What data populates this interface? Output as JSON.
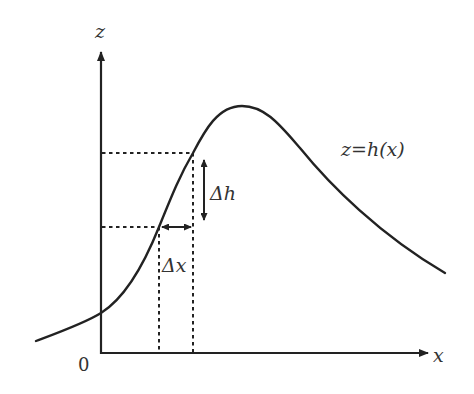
{
  "diagram": {
    "axes": {
      "z_label": "z",
      "x_label": "x",
      "origin_label": "0"
    },
    "curve_label": "z=h(x)",
    "delta_h_label": "Δh",
    "delta_x_label": "Δx",
    "colors": {
      "line": "#222222",
      "text": "#333333",
      "background": "#ffffff"
    }
  }
}
